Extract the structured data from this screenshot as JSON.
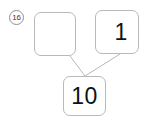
{
  "worksheet": {
    "problem_number": "16",
    "type": "number-bond",
    "colors": {
      "box_border": "#b9b9b9",
      "badge_border": "#8f8f8f",
      "connector": "#b9b9b9",
      "text": "#111111",
      "background": "#ffffff"
    }
  },
  "number_bond": {
    "parts": [
      {
        "id": "top-left",
        "role": "part",
        "value": "",
        "is_blank": true
      },
      {
        "id": "top-right",
        "role": "part",
        "value": "1",
        "is_blank": false
      }
    ],
    "whole": {
      "id": "bottom",
      "role": "whole",
      "value": "10",
      "is_blank": false
    },
    "connectors": [
      {
        "from": "top-left",
        "to": "bottom"
      },
      {
        "from": "top-right",
        "to": "bottom"
      }
    ]
  }
}
